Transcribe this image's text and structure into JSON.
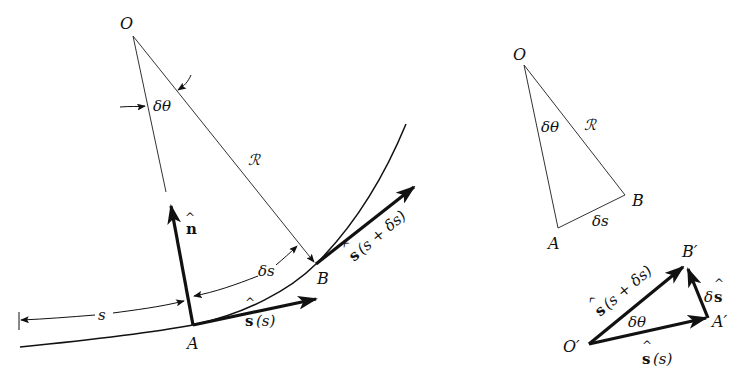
{
  "figure": {
    "left": {
      "labels": {
        "O": "O",
        "A": "A",
        "B": "B",
        "delta_theta": "δθ",
        "R": "ℛ",
        "delta_s": "δs",
        "s": "s",
        "n_hat": "n",
        "s_hat_s": "s(s)",
        "s_hat_s_plus": "s(s + δs)"
      }
    },
    "right_top": {
      "labels": {
        "O": "O",
        "A": "A",
        "B": "B",
        "delta_theta": "δθ",
        "R": "ℛ",
        "delta_s": "δs"
      }
    },
    "right_bottom": {
      "labels": {
        "O_prime": "O′",
        "A_prime": "A′",
        "B_prime": "B′",
        "delta_theta": "δθ",
        "s_hat_s": "s(s)",
        "s_hat_s_plus": "s(s + δs)",
        "delta_s_hat_delta": "δ",
        "delta_s_hat_s": "s"
      }
    },
    "hat_glyph": "^"
  }
}
